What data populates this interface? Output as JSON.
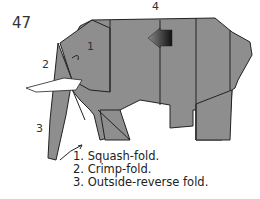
{
  "step": {
    "number": "47"
  },
  "callouts": {
    "c1": "1",
    "c2": "2",
    "c3": "3",
    "c4": "4"
  },
  "legend": {
    "items": [
      "1. Squash-fold.",
      "2. Crimp-fold.",
      "3. Outside-reverse fold."
    ]
  },
  "colors": {
    "paper": "#8e8e8e",
    "outline": "#222222",
    "tusk": "#ffffff"
  }
}
